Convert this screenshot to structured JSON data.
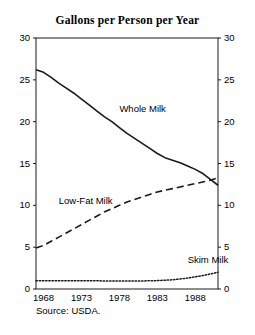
{
  "chart_data": {
    "type": "line",
    "title": "Gallons per Person per Year",
    "xlabel": "",
    "ylabel": "",
    "xlim": [
      1967,
      1991
    ],
    "ylim": [
      0,
      30
    ],
    "grid": false,
    "legend_position": "inline-annotations",
    "x_ticks": [
      "1968",
      "1973",
      "1978",
      "1983",
      "1988"
    ],
    "x_tick_values": [
      1968,
      1973,
      1978,
      1983,
      1988
    ],
    "y_ticks_left": [
      "30",
      "25",
      "20",
      "15",
      "10",
      "5",
      "0"
    ],
    "y_ticks_right": [
      "30",
      "25",
      "20",
      "15",
      "10",
      "5",
      "0"
    ],
    "y_tick_values": [
      30,
      25,
      20,
      15,
      10,
      5,
      0
    ],
    "x": [
      1967,
      1968,
      1969,
      1970,
      1971,
      1972,
      1973,
      1974,
      1975,
      1976,
      1977,
      1978,
      1979,
      1980,
      1981,
      1982,
      1983,
      1984,
      1985,
      1986,
      1987,
      1988,
      1989,
      1990,
      1991
    ],
    "series": [
      {
        "name": "Whole Milk",
        "style": "solid",
        "values": [
          26.2,
          25.9,
          25.3,
          24.6,
          24.0,
          23.4,
          22.7,
          22.0,
          21.3,
          20.6,
          20.0,
          19.3,
          18.6,
          18.0,
          17.4,
          16.8,
          16.2,
          15.7,
          15.4,
          15.1,
          14.7,
          14.3,
          13.8,
          13.1,
          12.4
        ],
        "label_text": "Whole Milk"
      },
      {
        "name": "Low-Fat Milk",
        "style": "dashed",
        "values": [
          4.9,
          5.2,
          5.7,
          6.2,
          6.7,
          7.2,
          7.7,
          8.2,
          8.7,
          9.2,
          9.6,
          10.0,
          10.4,
          10.7,
          11.0,
          11.3,
          11.6,
          11.8,
          12.0,
          12.2,
          12.4,
          12.6,
          12.8,
          13.0,
          13.3
        ],
        "label_text": "Low-Fat Milk"
      },
      {
        "name": "Skim Milk",
        "style": "dotted",
        "values": [
          1.0,
          1.0,
          1.0,
          1.0,
          1.0,
          1.0,
          1.0,
          1.0,
          1.0,
          0.95,
          0.95,
          0.95,
          0.95,
          0.95,
          0.95,
          1.0,
          1.0,
          1.05,
          1.1,
          1.2,
          1.3,
          1.45,
          1.6,
          1.8,
          2.0
        ],
        "label_text": "Skim Milk"
      }
    ],
    "annotations": [
      {
        "text": "Whole Milk",
        "x": 1978,
        "y": 21.5
      },
      {
        "text": "Low-Fat Milk",
        "x": 1970,
        "y": 10.5
      },
      {
        "text": "Skim Milk",
        "x": 1987,
        "y": 3.5
      }
    ],
    "source": "Source: USDA.",
    "colors": {
      "line": "#1a1a1a",
      "axis": "#1a1a1a",
      "background": "#ffffff",
      "text": "#000000"
    }
  }
}
